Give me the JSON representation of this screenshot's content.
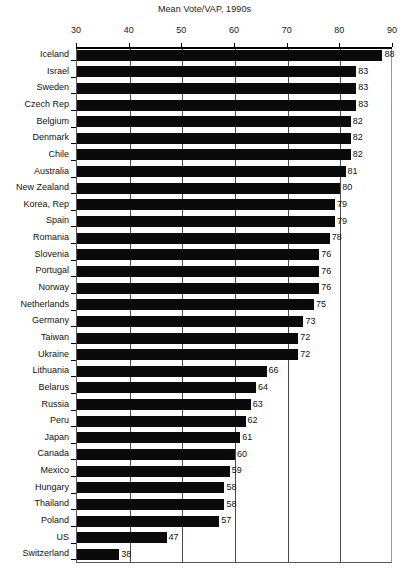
{
  "chart_data": {
    "type": "bar",
    "orientation": "horizontal",
    "title": "Mean Vote/VAP, 1990s",
    "xlabel": "",
    "ylabel": "",
    "xlim": [
      30,
      90
    ],
    "xticks": [
      30,
      40,
      50,
      60,
      70,
      80,
      90
    ],
    "grid": true,
    "grid_axis": "x",
    "legend": false,
    "bar_color": "#0a0a0a",
    "value_labels": true,
    "categories": [
      "Iceland",
      "Israel",
      "Sweden",
      "Czech Rep",
      "Belgium",
      "Denmark",
      "Chile",
      "Australia",
      "New Zealand",
      "Korea, Rep",
      "Spain",
      "Romania",
      "Slovenia",
      "Portugal",
      "Norway",
      "Netherlands",
      "Germany",
      "Taiwan",
      "Ukraine",
      "Lithuania",
      "Belarus",
      "Russia",
      "Peru",
      "Japan",
      "Canada",
      "Mexico",
      "Hungary",
      "Thailand",
      "Poland",
      "US",
      "Switzerland"
    ],
    "values": [
      88,
      83,
      83,
      83,
      82,
      82,
      82,
      81,
      80,
      79,
      79,
      78,
      76,
      76,
      76,
      75,
      73,
      72,
      72,
      66,
      64,
      63,
      62,
      61,
      60,
      59,
      58,
      58,
      57,
      47,
      38
    ]
  }
}
